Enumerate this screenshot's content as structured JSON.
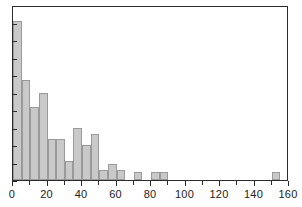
{
  "chart_data": {
    "type": "bar",
    "title": "",
    "subtitle": "",
    "xlabel": "",
    "ylabel": "",
    "xlim": [
      0,
      160
    ],
    "ylim": [
      0,
      11
    ],
    "grid": false,
    "legend": null,
    "bin_width": 5,
    "x_tick_labels": [
      "0",
      "20",
      "40",
      "60",
      "80",
      "100",
      "120",
      "140",
      "160"
    ],
    "x_tick_values": [
      0,
      20,
      40,
      60,
      80,
      100,
      120,
      140,
      160
    ],
    "x_minor_tick_step": 10,
    "y_tick_labels": [],
    "y_tick_count": 11,
    "bar_fill_color": "#c9c9c9",
    "bar_edge_color": "#9a9a9a",
    "axis_color": "#2b2b2b",
    "background_color": "#ffffff",
    "bins": [
      {
        "x0": 0,
        "x1": 5,
        "value": 10.0
      },
      {
        "x0": 5,
        "x1": 10,
        "value": 6.3
      },
      {
        "x0": 10,
        "x1": 15,
        "value": 4.6
      },
      {
        "x0": 15,
        "x1": 20,
        "value": 5.5
      },
      {
        "x0": 20,
        "x1": 25,
        "value": 2.6
      },
      {
        "x0": 25,
        "x1": 30,
        "value": 2.6
      },
      {
        "x0": 30,
        "x1": 35,
        "value": 1.2
      },
      {
        "x0": 35,
        "x1": 40,
        "value": 3.3
      },
      {
        "x0": 40,
        "x1": 45,
        "value": 2.2
      },
      {
        "x0": 45,
        "x1": 50,
        "value": 2.9
      },
      {
        "x0": 50,
        "x1": 55,
        "value": 0.6
      },
      {
        "x0": 55,
        "x1": 60,
        "value": 1.0
      },
      {
        "x0": 60,
        "x1": 65,
        "value": 0.6
      },
      {
        "x0": 70,
        "x1": 75,
        "value": 0.5
      },
      {
        "x0": 80,
        "x1": 85,
        "value": 0.5
      },
      {
        "x0": 85,
        "x1": 90,
        "value": 0.5
      },
      {
        "x0": 150,
        "x1": 155,
        "value": 0.5
      }
    ]
  }
}
